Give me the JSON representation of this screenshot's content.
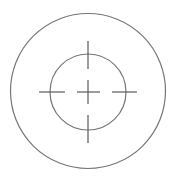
{
  "figure": {
    "background": "#ffffff",
    "stroke_color": "#5a5a5a",
    "circle_color": "#777777",
    "stroke_width": 1.2,
    "outer_circle": {
      "cx": 88,
      "cy": 91,
      "r": 77.5
    },
    "inner_circle": {
      "cx": 88,
      "cy": 92,
      "r": 38
    },
    "ticks": {
      "top": {
        "x1": 88,
        "y1": 41,
        "x2": 88,
        "y2": 69
      },
      "bottom": {
        "x1": 88,
        "y1": 115,
        "x2": 88,
        "y2": 143
      },
      "left": {
        "x1": 39,
        "y1": 92,
        "x2": 65,
        "y2": 92
      },
      "right": {
        "x1": 112,
        "y1": 92,
        "x2": 137,
        "y2": 92
      }
    },
    "center_cross": {
      "horizontal": {
        "x1": 77,
        "y1": 92,
        "x2": 100,
        "y2": 92
      },
      "vertical": {
        "x1": 88,
        "y1": 80,
        "x2": 88,
        "y2": 104
      }
    }
  }
}
